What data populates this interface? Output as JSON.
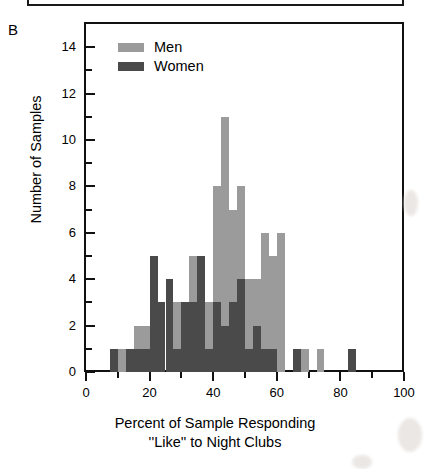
{
  "figure": {
    "panel_letter": "B",
    "legend": {
      "position": "top-left-inside",
      "entries": [
        {
          "label": "Men",
          "color": "#9b9b9b"
        },
        {
          "label": "Women",
          "color": "#4a4a4a"
        }
      ]
    }
  },
  "chart_data": {
    "type": "bar",
    "subtype": "overlapping-histogram",
    "title": "",
    "panel_letter": "B",
    "xlabel": "Percent of Sample Responding “Like” to Night Clubs",
    "xlabel_line1": "Percent of Sample Responding",
    "xlabel_line2": "''Like'' to Night Clubs",
    "ylabel": "Number of Samples",
    "xlim": [
      0,
      100
    ],
    "ylim": [
      0,
      15
    ],
    "bin_width": 2.5,
    "x_major_ticks": [
      0,
      20,
      40,
      60,
      80,
      100
    ],
    "x_minor_ticks": [
      10,
      30,
      50,
      70,
      90
    ],
    "x_tick_labels": [
      "0",
      "20",
      "40",
      "60",
      "80",
      "100"
    ],
    "y_major_ticks": [
      0,
      2,
      4,
      6,
      8,
      10,
      12,
      14
    ],
    "y_minor_ticks": [
      1,
      3,
      5,
      7,
      9,
      11,
      13
    ],
    "y_tick_labels": [
      "0",
      "2",
      "4",
      "6",
      "8",
      "10",
      "12",
      "14"
    ],
    "grid": false,
    "legend_position": "upper left",
    "bin_starts": [
      7.5,
      10,
      12.5,
      15,
      17.5,
      20,
      22.5,
      25,
      27.5,
      30,
      32.5,
      35,
      37.5,
      40,
      42.5,
      45,
      47.5,
      50,
      52.5,
      55,
      57.5,
      60,
      62.5,
      65,
      67.5,
      70,
      72.5,
      75,
      77.5,
      80,
      82.5,
      85
    ],
    "series": [
      {
        "name": "Men",
        "color": "#9b9b9b",
        "values": [
          0,
          1,
          1,
          2,
          2,
          3,
          3,
          2,
          3,
          3,
          5,
          5,
          3,
          8,
          11,
          7,
          8,
          4,
          4,
          6,
          5,
          6,
          0,
          1,
          1,
          0,
          1,
          0,
          0,
          0,
          0,
          0
        ]
      },
      {
        "name": "Women",
        "color": "#4a4a4a",
        "values": [
          1,
          0,
          1,
          1,
          1,
          5,
          3,
          4,
          1,
          3,
          3,
          5,
          1,
          3,
          2,
          3,
          4,
          1,
          2,
          1,
          1,
          0,
          0,
          1,
          0,
          0,
          0,
          0,
          0,
          0,
          1,
          0
        ]
      }
    ]
  }
}
